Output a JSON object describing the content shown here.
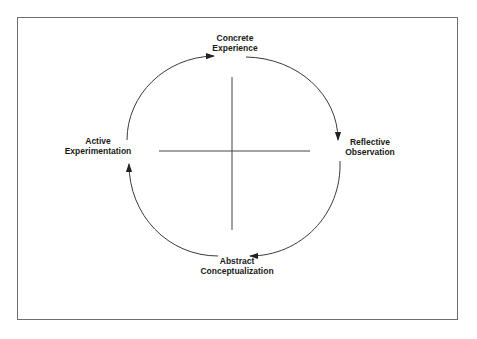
{
  "diagram": {
    "type": "cycle",
    "stages": [
      {
        "id": "concrete-experience",
        "line1": "Concrete",
        "line2": "Experience",
        "position": "top"
      },
      {
        "id": "reflective-observation",
        "line1": "Reflective",
        "line2": "Observation",
        "position": "right"
      },
      {
        "id": "abstract-conceptualization",
        "line1": "Abstract",
        "line2": "Conceptualization",
        "position": "bottom"
      },
      {
        "id": "active-experimentation",
        "line1": "Active",
        "line2": "Experimentation",
        "position": "left"
      }
    ],
    "flow": [
      {
        "from": "active-experimentation",
        "to": "concrete-experience",
        "direction": "clockwise"
      },
      {
        "from": "concrete-experience",
        "to": "reflective-observation",
        "direction": "clockwise"
      },
      {
        "from": "reflective-observation",
        "to": "abstract-conceptualization",
        "direction": "clockwise"
      },
      {
        "from": "abstract-conceptualization",
        "to": "active-experimentation",
        "direction": "clockwise"
      }
    ],
    "axes": {
      "vertical": "concrete-abstract",
      "horizontal": "active-reflective"
    },
    "colors": {
      "stroke": "#3a3a3a",
      "text": "#1a1a1a",
      "frame": "#6e6e6e"
    }
  }
}
